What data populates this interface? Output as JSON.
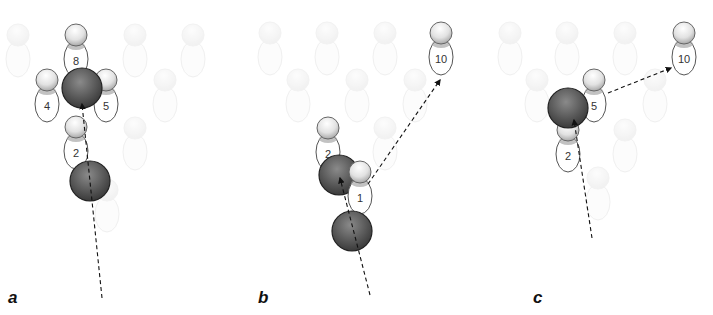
{
  "figure": {
    "panels": [
      {
        "label": "a",
        "faded_pins": [
          [
            18,
            35
          ],
          [
            135,
            35
          ],
          [
            193,
            35
          ],
          [
            165,
            80
          ],
          [
            135,
            128
          ],
          [
            107,
            190
          ]
        ],
        "pins": [
          {
            "num": "8",
            "x": 76,
            "y": 35
          },
          {
            "num": "4",
            "x": 47,
            "y": 80
          },
          {
            "num": "5",
            "x": 106,
            "y": 80
          },
          {
            "num": "2",
            "x": 76,
            "y": 127
          }
        ],
        "balls": [
          {
            "x": 82,
            "y": 88
          },
          {
            "x": 90,
            "y": 181
          }
        ],
        "paths": [
          {
            "from": [
              102,
              298
            ],
            "to": [
              82,
              104
            ]
          }
        ]
      },
      {
        "label": "b",
        "faded_pins": [
          [
            270,
            33
          ],
          [
            327,
            33
          ],
          [
            385,
            33
          ],
          [
            298,
            80
          ],
          [
            357,
            80
          ],
          [
            415,
            80
          ],
          [
            385,
            128
          ]
        ],
        "pins": [
          {
            "num": "10",
            "x": 441,
            "y": 33
          },
          {
            "num": "2",
            "x": 328,
            "y": 128
          },
          {
            "num": "1",
            "x": 360,
            "y": 172
          }
        ],
        "balls": [
          {
            "x": 339,
            "y": 175
          },
          {
            "x": 352,
            "y": 231
          }
        ],
        "paths": [
          {
            "from": [
              370,
              295
            ],
            "to": [
              340,
              178
            ]
          },
          {
            "from": [
              368,
              184
            ],
            "to": [
              440,
              80
            ]
          }
        ]
      },
      {
        "label": "c",
        "faded_pins": [
          [
            510,
            33
          ],
          [
            567,
            33
          ],
          [
            625,
            33
          ],
          [
            537,
            80
          ],
          [
            655,
            80
          ],
          [
            625,
            130
          ],
          [
            598,
            178
          ]
        ],
        "pins": [
          {
            "num": "10",
            "x": 684,
            "y": 33
          },
          {
            "num": "5",
            "x": 594,
            "y": 80
          },
          {
            "num": "2",
            "x": 568,
            "y": 130
          }
        ],
        "balls": [
          {
            "x": 568,
            "y": 108
          }
        ],
        "paths": [
          {
            "from": [
              592,
              238
            ],
            "to": [
              574,
              120
            ]
          },
          {
            "from": [
              608,
              93
            ],
            "to": [
              671,
              68
            ]
          }
        ]
      }
    ],
    "label_positions": [
      [
        8,
        303
      ],
      [
        258,
        303
      ],
      [
        533,
        303
      ]
    ]
  }
}
